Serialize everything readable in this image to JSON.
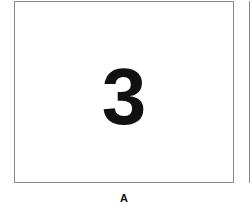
{
  "panel": {
    "digit": "3",
    "caption": "A"
  }
}
